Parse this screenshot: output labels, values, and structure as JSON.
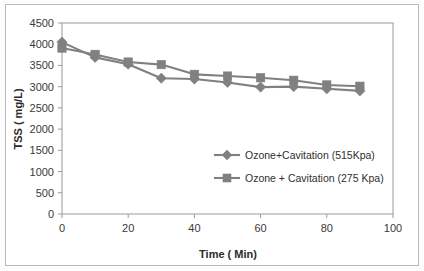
{
  "chart_data": {
    "type": "line",
    "title": "",
    "xlabel": "Time ( Min)",
    "ylabel": "TSS ( mg/L)",
    "xlim": [
      0,
      100
    ],
    "ylim": [
      0,
      4500
    ],
    "xticks": [
      0,
      20,
      40,
      60,
      80,
      100
    ],
    "yticks": [
      0,
      500,
      1000,
      1500,
      2000,
      2500,
      3000,
      3500,
      4000,
      4500
    ],
    "xtick_labels": [
      "0",
      "20",
      "40",
      "60",
      "80",
      "100"
    ],
    "ytick_labels": [
      "0",
      "500",
      "1000",
      "1500",
      "2000",
      "2500",
      "3000",
      "3500",
      "4000",
      "4500"
    ],
    "grid": false,
    "legend_position": "center-right-inside",
    "x": [
      0,
      10,
      20,
      30,
      40,
      50,
      60,
      70,
      80,
      90
    ],
    "series": [
      {
        "name": "Ozone+Cavitation (515Kpa)",
        "marker": "diamond",
        "color": "#808080",
        "values": [
          4050,
          3690,
          3530,
          3200,
          3180,
          3100,
          2990,
          3000,
          2950,
          2900
        ]
      },
      {
        "name": "Ozone + Cavitation (275 Kpa)",
        "marker": "square",
        "color": "#808080",
        "values": [
          3910,
          3760,
          3580,
          3520,
          3290,
          3250,
          3210,
          3150,
          3040,
          3010
        ]
      }
    ]
  },
  "style": {
    "line_color": "#808080",
    "axis_color": "#9a9a9a",
    "text_color": "#2f2f2f",
    "frame_color": "#b9b9b9",
    "background": "#ffffff"
  }
}
